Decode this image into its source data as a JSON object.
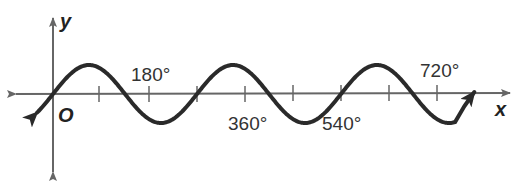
{
  "chart_data": {
    "type": "line",
    "title": "",
    "xlabel": "x",
    "ylabel": "y",
    "origin_label": "O",
    "x_tick_labels": [
      "180°",
      "360°",
      "540°",
      "720°"
    ],
    "x_ticks_degrees": [
      90,
      180,
      270,
      360,
      450,
      540,
      630,
      720
    ],
    "xlim_degrees": [
      -75,
      855
    ],
    "ylim": [
      -1.3,
      1.3
    ],
    "grid": false,
    "legend": null,
    "series": [
      {
        "name": "y = sin(4x/3)",
        "function": "sin",
        "amplitude": 1,
        "period_degrees": 270,
        "x_degrees": [
          0,
          67.5,
          135,
          202.5,
          270,
          337.5,
          405,
          472.5,
          540,
          607.5,
          675,
          742.5,
          780
        ],
        "values": [
          0,
          1,
          0,
          -1,
          0,
          1,
          0,
          -1,
          0,
          1,
          0,
          -1,
          -0.5
        ],
        "start_arrow": true,
        "end_arrow": true
      }
    ]
  },
  "labels": {
    "y_axis": "y",
    "x_axis": "x",
    "origin": "O",
    "tick_180": "180°",
    "tick_360": "360°",
    "tick_540": "540°",
    "tick_720": "720°"
  },
  "colors": {
    "axis": "#666666",
    "curve": "#2a2a2a",
    "text": "#333333"
  }
}
